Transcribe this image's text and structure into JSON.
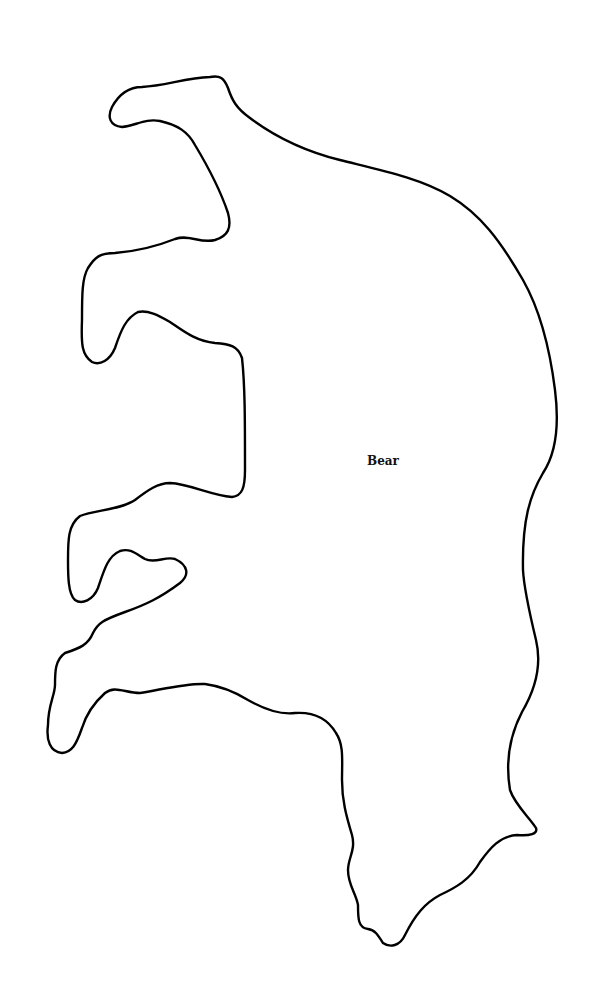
{
  "diagram": {
    "type": "outline-shape",
    "shape_label": "Bear",
    "stroke_color": "#000000",
    "fill_color": "#ffffff",
    "background_color": "#ffffff"
  }
}
